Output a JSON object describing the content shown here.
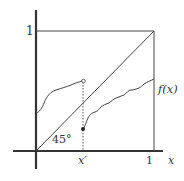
{
  "diagram": {
    "type": "function-plot",
    "labels": {
      "y_one": "1",
      "x_one": "1",
      "x_axis": "x",
      "x_prime": "x′",
      "function": "f(x)",
      "angle": "45°"
    },
    "colors": {
      "axis": "#333333",
      "line": "#444444",
      "background": "#ffffff"
    }
  }
}
